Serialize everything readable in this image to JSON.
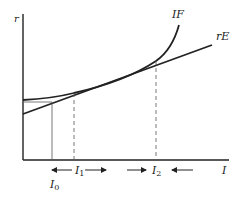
{
  "diagram": {
    "y_axis_label": "r",
    "x_axis_label": "I",
    "curves": [
      {
        "name": "IF",
        "label": "IF",
        "type": "convex curve"
      },
      {
        "name": "rE",
        "label": "rE",
        "type": "straight line"
      }
    ],
    "markers": [
      {
        "label": "I",
        "sub": "0",
        "line": "solid"
      },
      {
        "label": "I",
        "sub": "1",
        "line": "dashed"
      },
      {
        "label": "I",
        "sub": "2",
        "line": "dashed"
      }
    ],
    "arrows": {
      "around_I1": "arrows pointing toward I1 from left, away to right",
      "around_I2": "arrows pointing toward I2 from both sides"
    },
    "colors": {
      "ink": "#222222",
      "background": "#ffffff"
    }
  }
}
